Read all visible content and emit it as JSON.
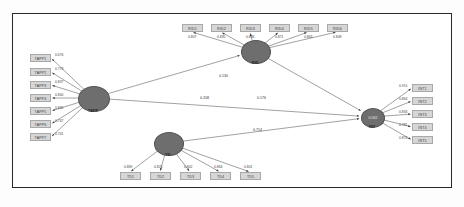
{
  "diagram": {
    "frame_color": "#2a2a2a",
    "node_color": "#6e6e6e",
    "box_color": "#d6d6d6"
  },
  "constructs": [
    {
      "id": "TAPP",
      "label": "TAPP",
      "value": "",
      "cx": 93,
      "cy": 98,
      "rx": 15,
      "ry": 12
    },
    {
      "id": "RID",
      "label": "RID",
      "value": "",
      "cx": 255,
      "cy": 51,
      "rx": 14,
      "ry": 11
    },
    {
      "id": "TD",
      "label": "TD",
      "value": "",
      "cx": 168,
      "cy": 143,
      "rx": 14,
      "ry": 11
    },
    {
      "id": "INT",
      "label": "INT",
      "value": "0.562",
      "cx": 372,
      "cy": 117,
      "rx": 11,
      "ry": 9
    }
  ],
  "indicators": {
    "tapp": [
      {
        "label": "TAPP1",
        "loading": "0.676",
        "x": 30,
        "y": 54
      },
      {
        "label": "TAPP2",
        "loading": "0.773",
        "x": 30,
        "y": 68
      },
      {
        "label": "TAPP3",
        "loading": "0.837",
        "x": 30,
        "y": 81
      },
      {
        "label": "TAPP4",
        "loading": "0.840",
        "x": 30,
        "y": 94
      },
      {
        "label": "TAPP5",
        "loading": "0.835",
        "x": 30,
        "y": 107
      },
      {
        "label": "TAPP6",
        "loading": "0.747",
        "x": 30,
        "y": 120
      },
      {
        "label": "TAPP7",
        "loading": "0.741",
        "x": 30,
        "y": 133
      }
    ],
    "rid": [
      {
        "label": "RID1",
        "loading": "0.807",
        "x": 182,
        "y": 24
      },
      {
        "label": "RID2",
        "loading": "0.835",
        "x": 211,
        "y": 24
      },
      {
        "label": "RID3",
        "loading": "0.836",
        "x": 240,
        "y": 24
      },
      {
        "label": "RID4",
        "loading": "0.871",
        "x": 269,
        "y": 24
      },
      {
        "label": "RID5",
        "loading": "0.863",
        "x": 298,
        "y": 24
      },
      {
        "label": "RID6",
        "loading": "0.848",
        "x": 327,
        "y": 24
      }
    ],
    "td": [
      {
        "label": "TD1",
        "loading": "0.869",
        "x": 120,
        "y": 172
      },
      {
        "label": "TD2",
        "loading": "0.825",
        "x": 150,
        "y": 172
      },
      {
        "label": "TD3",
        "loading": "0.802",
        "x": 180,
        "y": 172
      },
      {
        "label": "TD4",
        "loading": "0.864",
        "x": 210,
        "y": 172
      },
      {
        "label": "TD5",
        "loading": "0.841",
        "x": 240,
        "y": 172
      }
    ],
    "int": [
      {
        "label": "INT1",
        "loading": "0.915",
        "x": 412,
        "y": 84
      },
      {
        "label": "INT2",
        "loading": "0.864",
        "x": 412,
        "y": 97
      },
      {
        "label": "INT3",
        "loading": "0.834",
        "x": 412,
        "y": 110
      },
      {
        "label": "INT4",
        "loading": "0.781",
        "x": 412,
        "y": 123
      },
      {
        "label": "INT5",
        "loading": "0.874",
        "x": 412,
        "y": 136
      }
    ]
  },
  "paths": [
    {
      "id": "tapp-int",
      "from": "TAPP",
      "to": "INT",
      "coefficient": "0.208",
      "lx": 200,
      "ly": 96
    },
    {
      "id": "tapp-rid",
      "from": "TAPP",
      "to": "RID",
      "coefficient": "0.130",
      "lx": 219,
      "ly": 74
    },
    {
      "id": "rid-int",
      "from": "RID",
      "to": "INT",
      "coefficient": "0.176",
      "lx": 257,
      "ly": 96
    },
    {
      "id": "td-int",
      "from": "TD",
      "to": "INT",
      "coefficient": "0.714",
      "lx": 253,
      "ly": 128
    }
  ]
}
